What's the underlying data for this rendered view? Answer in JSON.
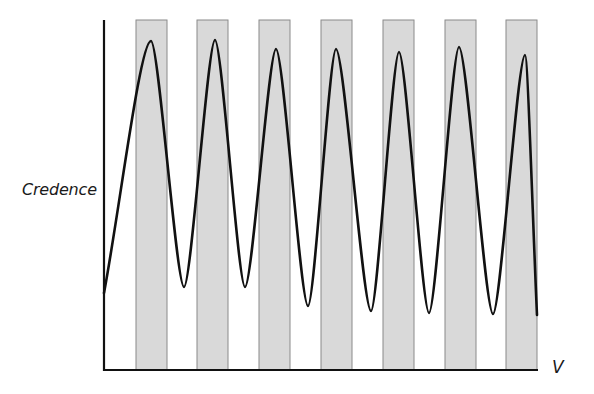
{
  "chart_data": {
    "type": "line",
    "title": "",
    "xlabel": "V",
    "ylabel": "Credence",
    "grid": false,
    "legend": null,
    "axes": {
      "origin_px": [
        104,
        370
      ],
      "y_top_px": 20,
      "x_right_px": 537,
      "x_ticks": [],
      "y_ticks": []
    },
    "shaded_bands": {
      "count": 7,
      "x_start_px": [
        136,
        197,
        259,
        321,
        383,
        445,
        506
      ],
      "width_px": 31,
      "top_px": 20,
      "bottom_px": 370,
      "fill": "#d9d9d9",
      "stroke": "#8a8a8a"
    },
    "series": [
      {
        "name": "Credence",
        "description": "Oscillating curve: starts low, rises to peak inside each shaded band and falls to trough in each white gap; troughs deepen slightly over V",
        "color": "#111111",
        "points_px": [
          [
            104,
            293
          ],
          [
            151,
            41
          ],
          [
            184,
            287
          ],
          [
            215,
            40
          ],
          [
            245,
            287
          ],
          [
            276,
            49
          ],
          [
            308,
            306
          ],
          [
            336,
            49
          ],
          [
            371,
            311
          ],
          [
            399,
            52
          ],
          [
            429,
            313
          ],
          [
            459,
            47
          ],
          [
            493,
            314
          ],
          [
            525,
            55
          ],
          [
            537,
            315
          ]
        ],
        "peaks": [
          {
            "x_px": 151,
            "y_px": 41
          },
          {
            "x_px": 215,
            "y_px": 40
          },
          {
            "x_px": 276,
            "y_px": 49
          },
          {
            "x_px": 336,
            "y_px": 49
          },
          {
            "x_px": 399,
            "y_px": 52
          },
          {
            "x_px": 459,
            "y_px": 47
          },
          {
            "x_px": 525,
            "y_px": 55
          }
        ],
        "troughs": [
          {
            "x_px": 184,
            "y_px": 287
          },
          {
            "x_px": 245,
            "y_px": 287
          },
          {
            "x_px": 308,
            "y_px": 306
          },
          {
            "x_px": 371,
            "y_px": 311
          },
          {
            "x_px": 429,
            "y_px": 313
          },
          {
            "x_px": 493,
            "y_px": 314
          }
        ]
      }
    ]
  },
  "labels": {
    "ylabel": "Credence",
    "xlabel": "V"
  }
}
